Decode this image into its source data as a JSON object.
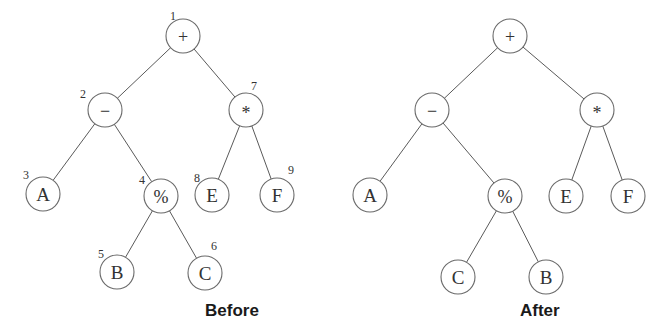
{
  "diagram": {
    "type": "expression-tree-transformation",
    "node_radius": 17,
    "colors": {
      "edge": "#5a5a5a",
      "node_stroke": "#6a6a6a",
      "node_fill": "#ffffff",
      "text": "#333333",
      "caption": "#1a1a1a"
    },
    "trees": [
      {
        "id": "before",
        "caption": "Before",
        "caption_pos": [
          205,
          316
        ],
        "nodes": [
          {
            "id": "n1",
            "label": "+",
            "index": "1",
            "x": 183,
            "y": 36,
            "idx_x": 170,
            "idx_y": 20,
            "op": true
          },
          {
            "id": "n2",
            "label": "−",
            "index": "2",
            "x": 105,
            "y": 110,
            "idx_x": 80,
            "idx_y": 98,
            "op": true
          },
          {
            "id": "n3",
            "label": "A",
            "index": "3",
            "x": 43,
            "y": 194,
            "idx_x": 23,
            "idx_y": 179,
            "op": false
          },
          {
            "id": "n4",
            "label": "%",
            "index": "4",
            "x": 161,
            "y": 196,
            "idx_x": 139,
            "idx_y": 184,
            "op": true
          },
          {
            "id": "n5",
            "label": "B",
            "index": "5",
            "x": 117,
            "y": 272,
            "idx_x": 98,
            "idx_y": 258,
            "op": false
          },
          {
            "id": "n6",
            "label": "C",
            "index": "6",
            "x": 205,
            "y": 273,
            "idx_x": 211,
            "idx_y": 250,
            "op": false
          },
          {
            "id": "n7",
            "label": "*",
            "index": "7",
            "x": 246,
            "y": 110,
            "idx_x": 251,
            "idx_y": 90,
            "op": true
          },
          {
            "id": "n8",
            "label": "E",
            "index": "8",
            "x": 212,
            "y": 195,
            "idx_x": 194,
            "idx_y": 182,
            "op": false
          },
          {
            "id": "n9",
            "label": "F",
            "index": "9",
            "x": 277,
            "y": 195,
            "idx_x": 288,
            "idx_y": 174,
            "op": false
          }
        ],
        "edges": [
          [
            "n1",
            "n2"
          ],
          [
            "n1",
            "n7"
          ],
          [
            "n2",
            "n3"
          ],
          [
            "n2",
            "n4"
          ],
          [
            "n4",
            "n5"
          ],
          [
            "n4",
            "n6"
          ],
          [
            "n7",
            "n8"
          ],
          [
            "n7",
            "n9"
          ]
        ]
      },
      {
        "id": "after",
        "caption": "After",
        "caption_pos": [
          520,
          316
        ],
        "nodes": [
          {
            "id": "m1",
            "label": "+",
            "x": 510,
            "y": 36,
            "op": true
          },
          {
            "id": "m2",
            "label": "−",
            "x": 432,
            "y": 110,
            "op": true
          },
          {
            "id": "m3",
            "label": "A",
            "x": 370,
            "y": 195,
            "op": false
          },
          {
            "id": "m4",
            "label": "%",
            "x": 505,
            "y": 196,
            "op": true
          },
          {
            "id": "m5",
            "label": "C",
            "x": 458,
            "y": 277,
            "op": false
          },
          {
            "id": "m6",
            "label": "B",
            "x": 546,
            "y": 277,
            "op": false
          },
          {
            "id": "m7",
            "label": "*",
            "x": 597,
            "y": 110,
            "op": true
          },
          {
            "id": "m8",
            "label": "E",
            "x": 566,
            "y": 196,
            "op": false
          },
          {
            "id": "m9",
            "label": "F",
            "x": 628,
            "y": 196,
            "op": false
          }
        ],
        "edges": [
          [
            "m1",
            "m2"
          ],
          [
            "m1",
            "m7"
          ],
          [
            "m2",
            "m3"
          ],
          [
            "m2",
            "m4"
          ],
          [
            "m4",
            "m5"
          ],
          [
            "m4",
            "m6"
          ],
          [
            "m7",
            "m8"
          ],
          [
            "m7",
            "m9"
          ]
        ]
      }
    ]
  }
}
